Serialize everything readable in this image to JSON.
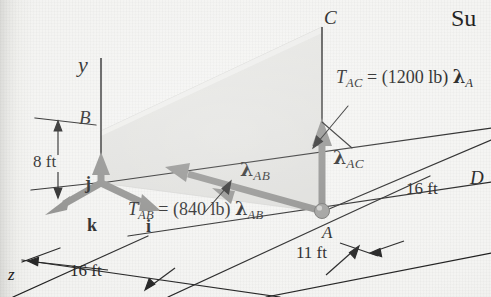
{
  "figure": {
    "type": "statics-free-body-diagram",
    "background_color": "#f2f2f0",
    "ink_color": "#1b1b1b",
    "vector_color": "#8a8a8a",
    "plane_fill_color": "#e2e2df"
  },
  "axes": {
    "y_label": "y",
    "z_label": "z"
  },
  "points": {
    "A": "A",
    "B": "B",
    "C": "C",
    "D": "D"
  },
  "unit_vectors": {
    "i": "i",
    "j": "j",
    "k": "k"
  },
  "dimensions": [
    {
      "name": "height-B",
      "value": "8 ft"
    },
    {
      "name": "z-depth",
      "value": "16 ft"
    },
    {
      "name": "x-offset",
      "value": "11 ft"
    },
    {
      "name": "x-depth",
      "value": "16 ft"
    }
  ],
  "vectors": {
    "T_AB": {
      "symbol": "T",
      "subscript": "AB",
      "equals": " = (",
      "magnitude": "840 lb",
      "close": ") ",
      "lambda": "λ",
      "lambda_subscript": "AB"
    },
    "T_AC": {
      "symbol": "T",
      "subscript": "AC",
      "equals": " = (",
      "magnitude": "1200 lb",
      "close": ") ",
      "lambda": "λ",
      "lambda_subscript": "A"
    },
    "lambda_AB": {
      "lambda": "λ",
      "subscript": "AB"
    },
    "lambda_AC": {
      "lambda": "λ",
      "subscript": "AC"
    }
  },
  "page_text": {
    "cut_off_heading": "Su"
  }
}
